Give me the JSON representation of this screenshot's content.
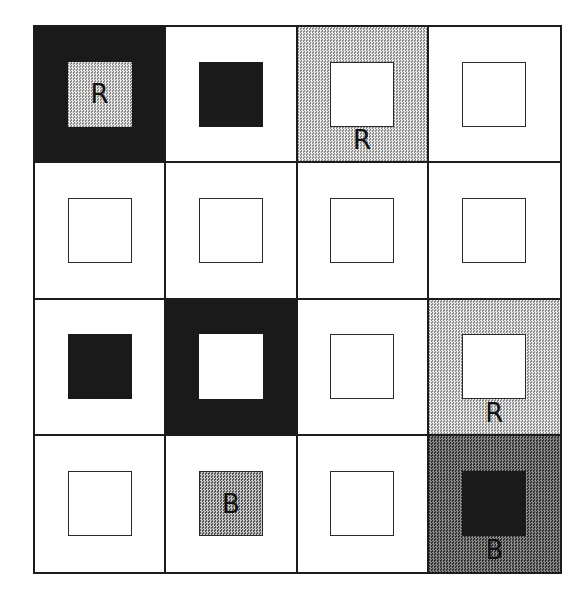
{
  "figure": {
    "rows": 4,
    "cols": 4,
    "cells": [
      {
        "row": 0,
        "col": 0,
        "bg": "black",
        "inner": "stipple-light",
        "label": "R",
        "label_pos": "inside"
      },
      {
        "row": 0,
        "col": 1,
        "bg": "white",
        "inner": "black",
        "label": "",
        "label_pos": ""
      },
      {
        "row": 0,
        "col": 2,
        "bg": "stipple-light",
        "inner": "outline",
        "label": "R",
        "label_pos": "below"
      },
      {
        "row": 0,
        "col": 3,
        "bg": "white",
        "inner": "outline",
        "label": "",
        "label_pos": ""
      },
      {
        "row": 1,
        "col": 0,
        "bg": "white",
        "inner": "outline",
        "label": "",
        "label_pos": ""
      },
      {
        "row": 1,
        "col": 1,
        "bg": "white",
        "inner": "outline",
        "label": "",
        "label_pos": ""
      },
      {
        "row": 1,
        "col": 2,
        "bg": "white",
        "inner": "outline",
        "label": "",
        "label_pos": ""
      },
      {
        "row": 1,
        "col": 3,
        "bg": "white",
        "inner": "outline",
        "label": "",
        "label_pos": ""
      },
      {
        "row": 2,
        "col": 0,
        "bg": "white",
        "inner": "black",
        "label": "",
        "label_pos": ""
      },
      {
        "row": 2,
        "col": 1,
        "bg": "black",
        "inner": "white",
        "label": "",
        "label_pos": ""
      },
      {
        "row": 2,
        "col": 2,
        "bg": "white",
        "inner": "outline",
        "label": "",
        "label_pos": ""
      },
      {
        "row": 2,
        "col": 3,
        "bg": "stipple-light",
        "inner": "outline",
        "label": "R",
        "label_pos": "below"
      },
      {
        "row": 3,
        "col": 0,
        "bg": "white",
        "inner": "outline",
        "label": "",
        "label_pos": ""
      },
      {
        "row": 3,
        "col": 1,
        "bg": "white",
        "inner": "stipple-medium",
        "label": "B",
        "label_pos": "inside"
      },
      {
        "row": 3,
        "col": 2,
        "bg": "white",
        "inner": "outline",
        "label": "",
        "label_pos": ""
      },
      {
        "row": 3,
        "col": 3,
        "bg": "stipple-dark",
        "inner": "black",
        "label": "B",
        "label_pos": "below"
      }
    ],
    "palette": {
      "black": "#1a1a1a",
      "grid_line": "#1c1c1c",
      "label_color": "#111111",
      "stipple_light_a": "#e8e8e8",
      "stipple_light_b": "#8a8a8a",
      "stipple_medium_a": "#c8c8c8",
      "stipple_medium_b": "#565656",
      "stipple_dark_a": "#8a8a8a",
      "stipple_dark_b": "#2e2e2e"
    }
  }
}
